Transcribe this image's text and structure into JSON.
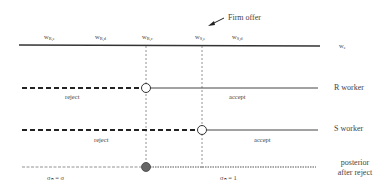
{
  "diagram": {
    "annotation": {
      "label": "Firm offer"
    },
    "axis": {
      "label": "w",
      "label_sub": "e",
      "ticks": [
        {
          "base": "w",
          "sub": "R,e"
        },
        {
          "base": "w",
          "sub": "R,d"
        },
        {
          "base": "w",
          "sub": "R,c"
        },
        {
          "base": "w",
          "sub": "S,e"
        },
        {
          "base": "w",
          "sub": "S,d"
        }
      ]
    },
    "rows": [
      {
        "name": "R worker",
        "left_label": "reject",
        "right_label": "accept"
      },
      {
        "name": "S worker",
        "left_label": "reject",
        "right_label": "accept"
      },
      {
        "name_line1": "posterior",
        "name_line2": "after reject",
        "left_label": "σₙ = σ",
        "right_label": "σₙ = 1"
      }
    ],
    "colors": {
      "line": "#333333",
      "dashed": "#222222",
      "dotted": "#666666",
      "filled_marker": "#666666"
    }
  }
}
